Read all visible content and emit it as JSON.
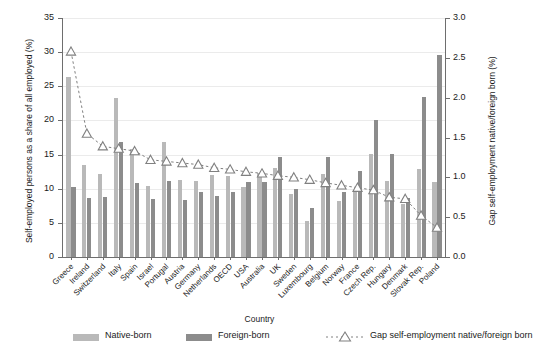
{
  "chart_data": {
    "type": "bar",
    "title": "",
    "xlabel": "Country",
    "ylabel": "Self-employed persons as a share of all employed (%)",
    "ylabel_right": "Gap self-employment native/foreign born (%)",
    "ylim": [
      0,
      35
    ],
    "ylim_right": [
      0,
      3.0
    ],
    "yticks": [
      "0",
      "5",
      "10",
      "15",
      "20",
      "25",
      "30",
      "35"
    ],
    "yticks_right": [
      "0.0",
      "0.5",
      "1.0",
      "1.5",
      "2.0",
      "2.5",
      "3.0"
    ],
    "grid": true,
    "legend_position": "bottom",
    "categories": [
      "Greece",
      "Ireland",
      "Switzerland",
      "Italy",
      "Spain",
      "Israel",
      "Portugal",
      "Austria",
      "Germany",
      "Netherlands",
      "OECD",
      "USA",
      "Australia",
      "UK",
      "Sweden",
      "Luxembourg",
      "Belgium",
      "Norway",
      "France",
      "Czech Rep.",
      "Hungary",
      "Denmark",
      "Slovak Rep.",
      "Poland"
    ],
    "series": [
      {
        "name": "Native-born",
        "color": "#b9b9b9",
        "axis": "left",
        "values": [
          26.4,
          13.5,
          12.2,
          23.3,
          15.8,
          10.4,
          16.8,
          11.3,
          11.2,
          12.0,
          11.9,
          10.2,
          12.3,
          13.0,
          9.2,
          5.2,
          12.2,
          8.2,
          9.6,
          15.1,
          11.1,
          7.7,
          12.9,
          11.0
        ]
      },
      {
        "name": "Foreign-born",
        "color": "#8c8c8c",
        "axis": "left",
        "values": [
          10.2,
          8.7,
          8.8,
          16.8,
          10.9,
          8.5,
          11.2,
          8.3,
          9.5,
          9.0,
          9.5,
          11.0,
          11.0,
          14.7,
          10.0,
          7.2,
          14.7,
          9.5,
          12.6,
          20.1,
          15.1,
          8.6,
          23.4,
          29.6
        ]
      },
      {
        "name": "Gap self-employment native/foreign born",
        "color": "#808080",
        "axis": "right",
        "marker": "triangle-up",
        "linestyle": "dashed",
        "values": [
          2.58,
          1.55,
          1.39,
          1.36,
          1.33,
          1.22,
          1.2,
          1.18,
          1.16,
          1.12,
          1.1,
          1.07,
          1.05,
          1.02,
          1.0,
          0.97,
          0.93,
          0.9,
          0.87,
          0.84,
          0.75,
          0.73,
          0.52,
          0.37
        ]
      }
    ]
  },
  "legend": {
    "native_label": "Native-born",
    "foreign_label": "Foreign-born",
    "gap_label": "Gap self-employment native/foreign born"
  }
}
